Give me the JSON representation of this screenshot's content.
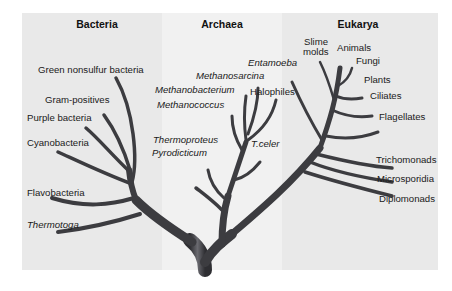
{
  "domains": [
    {
      "name": "Bacteria",
      "header_x": 97
    },
    {
      "name": "Archaea",
      "header_x": 222
    },
    {
      "name": "Eukarya",
      "header_x": 358
    }
  ],
  "labels": {
    "bacteria": [
      {
        "text": "Green nonsulfur bacteria",
        "italic": false
      },
      {
        "text": "Gram-positives",
        "italic": false
      },
      {
        "text": "Purple bacteria",
        "italic": false
      },
      {
        "text": "Cyanobacteria",
        "italic": false
      },
      {
        "text": "Flavobacteria",
        "italic": false
      },
      {
        "text": "Thermotoga",
        "italic": true
      }
    ],
    "archaea": [
      {
        "text": "Methanosarcina",
        "italic": true
      },
      {
        "text": "Methanobacterium",
        "italic": true
      },
      {
        "text": "Halophiles",
        "italic": false
      },
      {
        "text": "Methanococcus",
        "italic": true
      },
      {
        "text": "Thermoproteus",
        "italic": true
      },
      {
        "text": "Pyrodicticum",
        "italic": true
      },
      {
        "text": "T.celer",
        "italic": true
      }
    ],
    "eukarya": [
      {
        "text": "Slime",
        "italic": false
      },
      {
        "text": "molds",
        "italic": false
      },
      {
        "text": "Animals",
        "italic": false
      },
      {
        "text": "Entamoeba",
        "italic": true
      },
      {
        "text": "Fungi",
        "italic": false
      },
      {
        "text": "Plants",
        "italic": false
      },
      {
        "text": "Ciliates",
        "italic": false
      },
      {
        "text": "Flagellates",
        "italic": false
      },
      {
        "text": "Trichomonads",
        "italic": false
      },
      {
        "text": "Microsporidia",
        "italic": false
      },
      {
        "text": "Diplomonads",
        "italic": false
      }
    ]
  },
  "colors": {
    "panel_dark": "#e9e9e9",
    "panel_light": "#f1f1f1",
    "branch": "#3c3c40",
    "text": "#1a1a1a"
  }
}
